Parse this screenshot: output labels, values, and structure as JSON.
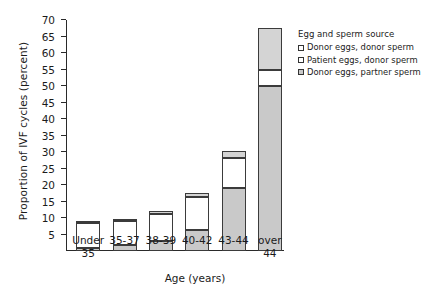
{
  "chart_data": {
    "type": "bar",
    "title": "",
    "xlabel": "Age (years)",
    "ylabel": "Proportion of IVF cycles (percent)",
    "ylim": [
      0,
      70
    ],
    "ytick_step": 5,
    "yticks": [
      5,
      10,
      15,
      20,
      25,
      30,
      35,
      40,
      45,
      50,
      55,
      60,
      65,
      70
    ],
    "ytick_labels": [
      "5",
      "10",
      "15",
      "20",
      "25",
      "30",
      "35",
      "40",
      "45",
      "50",
      "55",
      "60",
      "65",
      "70"
    ],
    "grid": false,
    "stacked": true,
    "legend_position": "right",
    "legend_title": "Egg and sperm source",
    "categories": [
      "Under 35",
      "35-37",
      "38-39",
      "40-42",
      "43-44",
      "over 44"
    ],
    "series": [
      {
        "name": "Donor eggs, partner sperm",
        "color": "#c9c9c9",
        "values": [
          0.8,
          1.8,
          3.0,
          6.3,
          19.0,
          50.0
        ]
      },
      {
        "name": "Patient eggs, donor sperm",
        "color": "#ffffff",
        "values": [
          7.7,
          7.4,
          8.3,
          10.2,
          9.3,
          5.0
        ]
      },
      {
        "name": "Donor eggs, donor sperm",
        "color": "#d4d4d4",
        "values": [
          0.5,
          0.6,
          0.7,
          1.0,
          1.9,
          12.5
        ]
      }
    ],
    "totals": [
      9.0,
      9.8,
      12.0,
      17.5,
      30.2,
      67.5
    ]
  },
  "legend": {
    "title": "Egg and sperm source",
    "items": [
      {
        "label": "Donor eggs, donor sperm",
        "swatch": "donor-donor"
      },
      {
        "label": "Patient eggs,  donor sperm",
        "swatch": "patient-donor"
      },
      {
        "label": "Donor eggs, partner sperm",
        "swatch": "donor-partner"
      }
    ]
  },
  "axes": {
    "x_title": "Age (years)",
    "y_title": "Proportion of IVF cycles (percent)",
    "x_labels": [
      {
        "line1": "Under",
        "line2": "35"
      },
      {
        "line1": "35-37",
        "line2": ""
      },
      {
        "line1": "38-39",
        "line2": ""
      },
      {
        "line1": "40-42",
        "line2": ""
      },
      {
        "line1": "43-44",
        "line2": ""
      },
      {
        "line1": "over",
        "line2": "44"
      }
    ]
  }
}
